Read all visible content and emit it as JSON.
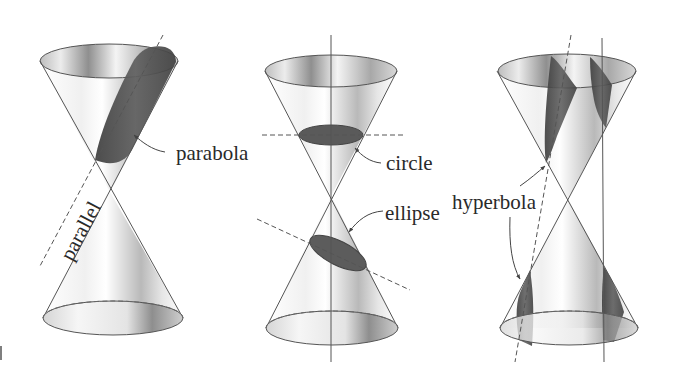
{
  "figure": {
    "colors": {
      "line": "#555555",
      "shade_dark": "#4a4a4a",
      "shade_mid": "#9a9a9a",
      "shade_light": "#e8e8e8",
      "text": "#2a2a2a"
    },
    "panels": [
      {
        "id": "parabola-panel",
        "labels": {
          "section": "parabola",
          "plane": "parallel"
        }
      },
      {
        "id": "circle-ellipse-panel",
        "labels": {
          "section_top": "circle",
          "section_bottom": "ellipse"
        }
      },
      {
        "id": "hyperbola-panel",
        "labels": {
          "section": "hyperbola"
        }
      }
    ]
  }
}
